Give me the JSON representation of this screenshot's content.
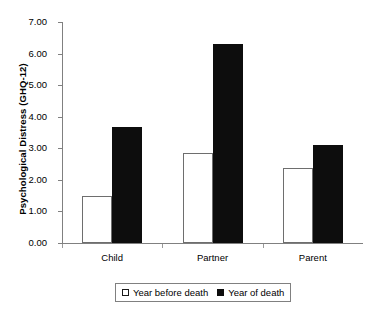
{
  "chart_data": {
    "type": "bar",
    "title": "",
    "xlabel": "",
    "ylabel": "Psychological Distress (GHQ-12)",
    "categories": [
      "Child",
      "Partner",
      "Parent"
    ],
    "series": [
      {
        "name": "Year before death",
        "values": [
          1.48,
          2.85,
          2.37
        ],
        "style": "open",
        "color": "#ffffff"
      },
      {
        "name": "Year of death",
        "values": [
          3.68,
          6.3,
          3.1
        ],
        "style": "filled",
        "color": "#0d0d0d"
      }
    ],
    "ylim": [
      0.0,
      7.0
    ],
    "ytick_values": [
      0.0,
      1.0,
      2.0,
      3.0,
      4.0,
      5.0,
      6.0,
      7.0
    ],
    "ytick_labels": [
      "0.00",
      "1.00",
      "2.00",
      "3.00",
      "4.00",
      "5.00",
      "6.00",
      "7.00"
    ],
    "grid": false,
    "legend_position": "bottom"
  },
  "axis": {
    "y_title": "Psychological Distress (GHQ-12)",
    "ticks": [
      {
        "label": "7.00",
        "value": 7.0
      },
      {
        "label": "6.00",
        "value": 6.0
      },
      {
        "label": "5.00",
        "value": 5.0
      },
      {
        "label": "4.00",
        "value": 4.0
      },
      {
        "label": "3.00",
        "value": 3.0
      },
      {
        "label": "2.00",
        "value": 2.0
      },
      {
        "label": "1.00",
        "value": 1.0
      },
      {
        "label": "0.00",
        "value": 0.0
      }
    ]
  },
  "categories": [
    {
      "label": "Child"
    },
    {
      "label": "Partner"
    },
    {
      "label": "Parent"
    }
  ],
  "legend": {
    "entries": [
      {
        "label": "Year before death",
        "style": "open"
      },
      {
        "label": "Year of death",
        "style": "filled"
      }
    ]
  }
}
